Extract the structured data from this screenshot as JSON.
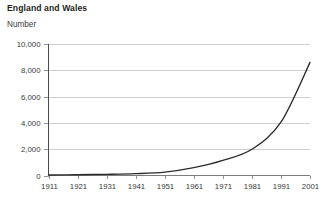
{
  "chart_data": {
    "type": "line",
    "title": "England and Wales",
    "subtitle": "Number",
    "ylabel": "Number",
    "xlabel": "",
    "grid": true,
    "legend": false,
    "xlim": [
      1911,
      2001
    ],
    "ylim": [
      0,
      10000
    ],
    "ytick_labels": [
      "10,000",
      "8,000",
      "6,000",
      "4,000",
      "2,000",
      "0"
    ],
    "ytick_values": [
      10000,
      8000,
      6000,
      4000,
      2000,
      0
    ],
    "xtick_labels": [
      "1911",
      "1921",
      "1931",
      "1941",
      "1951",
      "1961",
      "1971",
      "1981",
      "1991",
      "2001"
    ],
    "x": [
      1911,
      1921,
      1931,
      1941,
      1951,
      1961,
      1971,
      1981,
      1991,
      2001
    ],
    "series": [
      {
        "name": "Number",
        "color": "#2b2b2b",
        "values": [
          40,
          60,
          90,
          140,
          260,
          600,
          1150,
          2000,
          4050,
          8600
        ]
      }
    ],
    "colors": {
      "line": "#2b2b2b",
      "gridline": "#c9c9c9",
      "axis": "#4a4a4a",
      "baseline": "#7d7d7d",
      "text": "#231f20",
      "tick_text": "#3a3a3a",
      "background": "#ffffff"
    }
  }
}
